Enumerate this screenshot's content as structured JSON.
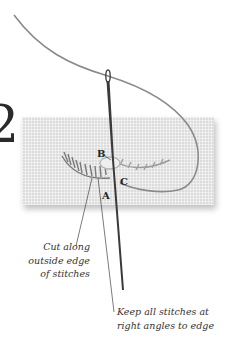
{
  "figure": {
    "step_number": "2",
    "point_labels": {
      "a": "A",
      "b": "B",
      "c": "C"
    },
    "captions": {
      "cut": {
        "line1": "Cut along",
        "line2": "outside edge",
        "line3": "of stitches"
      },
      "keep": {
        "line1": "Keep all stitches at",
        "line2": "right angles to edge"
      }
    },
    "colors": {
      "fabric": "#dcdcdc",
      "thread": "#8a8a8a",
      "needle": "#3a3a3a",
      "text": "#333333"
    }
  }
}
